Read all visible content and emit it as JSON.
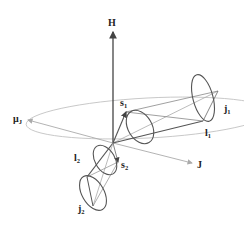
{
  "diagram": {
    "colors": {
      "dark": "#555555",
      "light": "#aaaaaa",
      "text": "#222222"
    },
    "labels": {
      "H": {
        "main": "H",
        "sub": ""
      },
      "J": {
        "main": "J",
        "sub": ""
      },
      "muJ": {
        "main": "μ",
        "sub": "J"
      },
      "s1": {
        "main": "s",
        "sub": "1"
      },
      "j1": {
        "main": "j",
        "sub": "1"
      },
      "l1": {
        "main": "l",
        "sub": "1"
      },
      "l2": {
        "main": "l",
        "sub": "2"
      },
      "s2": {
        "main": "s",
        "sub": "2"
      },
      "j2": {
        "main": "j",
        "sub": "2"
      }
    }
  }
}
